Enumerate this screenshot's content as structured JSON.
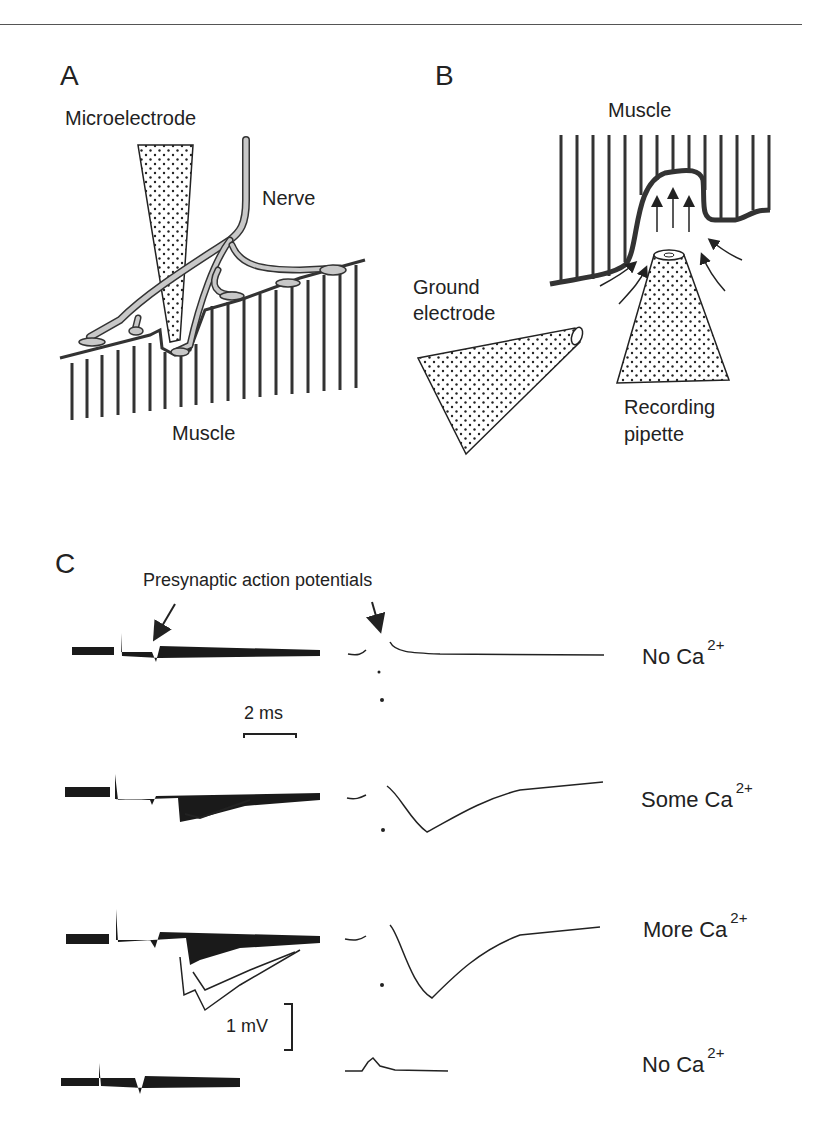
{
  "figure": {
    "top_rule": true,
    "panels": {
      "A": {
        "letter": "A",
        "labels": {
          "microelectrode": "Microelectrode",
          "nerve": "Nerve",
          "muscle": "Muscle"
        }
      },
      "B": {
        "letter": "B",
        "labels": {
          "muscle": "Muscle",
          "ground_electrode_line1": "Ground",
          "ground_electrode_line2": "electrode",
          "recording_pipette_line1": "Recording",
          "recording_pipette_line2": "pipette"
        }
      },
      "C": {
        "letter": "C",
        "annotation": "Presynaptic action potentials",
        "scale_bars": {
          "time": "2 ms",
          "voltage": "1 mV"
        },
        "traces": [
          {
            "condition": "No Ca",
            "superscript": "2+"
          },
          {
            "condition": "Some Ca",
            "superscript": "2+"
          },
          {
            "condition": "More Ca",
            "superscript": "2+"
          },
          {
            "condition": "No Ca",
            "superscript": "2+"
          }
        ]
      }
    },
    "colors": {
      "ink": "#222222",
      "nerve_fill": "#c8c8c8",
      "rule": "#555555"
    }
  }
}
